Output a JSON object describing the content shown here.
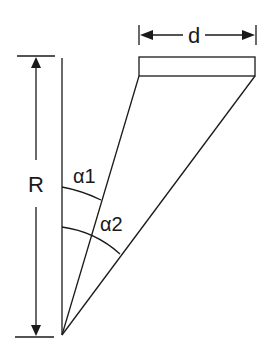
{
  "diagram": {
    "labels": {
      "width": "d",
      "radius": "R",
      "angle1": "α1",
      "angle2": "α2"
    },
    "colors": {
      "stroke": "#1a1a1a",
      "background": "#ffffff"
    }
  }
}
